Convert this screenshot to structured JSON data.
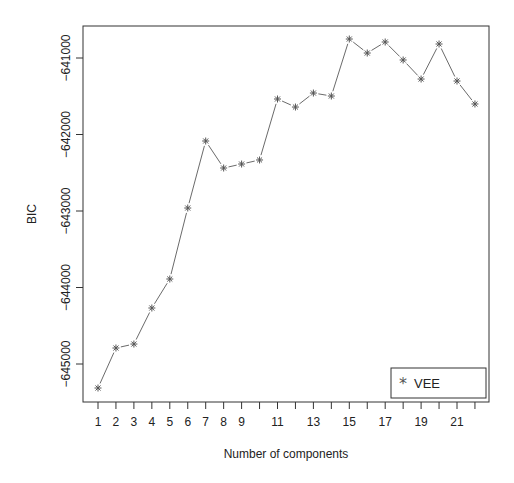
{
  "chart_data": {
    "type": "line",
    "title": "",
    "xlabel": "Number of components",
    "ylabel": "BIC",
    "x": [
      1,
      2,
      3,
      4,
      5,
      6,
      7,
      8,
      9,
      10,
      11,
      12,
      13,
      14,
      15,
      16,
      17,
      18,
      19,
      20,
      21,
      22
    ],
    "x_tick_labels": [
      "1",
      "2",
      "3",
      "4",
      "5",
      "6",
      "7",
      "8",
      "9",
      "11",
      "13",
      "15",
      "17",
      "19",
      "21"
    ],
    "x_tick_label_positions": [
      1,
      2,
      3,
      4,
      5,
      6,
      7,
      8,
      9,
      11,
      13,
      15,
      17,
      19,
      21
    ],
    "y_ticks": [
      -641000,
      -642000,
      -643000,
      -644000,
      -645000
    ],
    "y_tick_labels": [
      "-641000",
      "-642000",
      "-643000",
      "-644000",
      "-645000"
    ],
    "ylim": [
      -645400,
      -640550
    ],
    "xlim": [
      0.3,
      22.7
    ],
    "grid": false,
    "legend_position": "bottom-right",
    "series": [
      {
        "name": "VEE",
        "marker": "asterisk",
        "color": "#555555",
        "values": [
          -645314,
          -644791,
          -644739,
          -644268,
          -643889,
          -642961,
          -642085,
          -642438,
          -642386,
          -642333,
          -641536,
          -641641,
          -641458,
          -641497,
          -640752,
          -640935,
          -640791,
          -641026,
          -641275,
          -640817,
          -641301,
          -641601
        ]
      }
    ]
  },
  "legend": {
    "items": [
      {
        "label": "VEE",
        "symbol": "*"
      }
    ]
  }
}
